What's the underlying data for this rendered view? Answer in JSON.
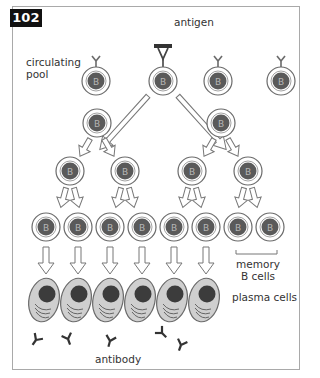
{
  "figure": {
    "number": "102",
    "labels": {
      "antigen": "antigen",
      "circulating_pool": "circulating\npool",
      "circulating_pool_line1": "circulating",
      "circulating_pool_line2": "pool",
      "memory_b_cells_line1": "memory",
      "memory_b_cells_line2": "B cells",
      "plasma_cells": "plasma cells",
      "antibody": "antibody"
    },
    "cell_letter": "B",
    "colors": {
      "nucleus": "#5a5a5a",
      "cell_ring": "#ffffff",
      "cell_outline": "#6a6a6a",
      "plasma_body": "#cfcfcf",
      "plasma_nucleus": "#3c3c3c",
      "antigen_bar": "#333333",
      "frame_border": "#a9a9a9",
      "badge_bg": "#111111"
    },
    "rows": [
      {
        "name": "circulating pool",
        "cells": 4,
        "note": "one cell binds antigen"
      },
      {
        "name": "first division",
        "cells": 2
      },
      {
        "name": "second division",
        "cells": 4
      },
      {
        "name": "third division",
        "cells": 8,
        "note": "last two are memory B cells"
      },
      {
        "name": "plasma cells",
        "cells": 6
      }
    ],
    "antibodies_count": 6
  }
}
